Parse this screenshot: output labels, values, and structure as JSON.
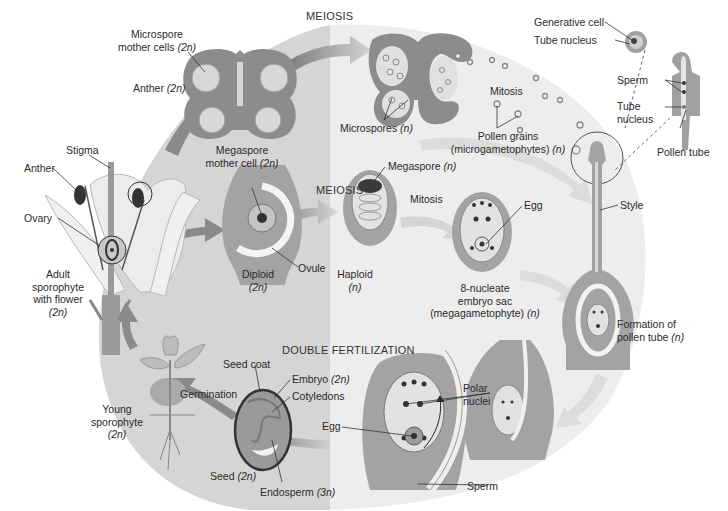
{
  "colors": {
    "diploid_bg": "#d4d4d4",
    "haploid_bg": "#ececec",
    "tissue_dark": "#8c8c8c",
    "tissue_mid": "#a9a9a9",
    "tissue_light": "#c8c8c8",
    "cell_light": "#e2e2e2",
    "arrow": "#8a8a8a",
    "arrow_light": "#cfcfcf"
  },
  "stages": {
    "meiosis_top": "MEIOSIS",
    "meiosis_mid": "MEIOSIS",
    "double_fertilization": "DOUBLE FERTILIZATION",
    "mitosis_top": "Mitosis",
    "mitosis_mid": "Mitosis",
    "germination": "Germination"
  },
  "regions": {
    "diploid": {
      "label": "Diploid",
      "ploidy": "(2n)"
    },
    "haploid": {
      "label": "Haploid",
      "ploidy": "(n)"
    }
  },
  "labels": {
    "microspore_mother_cells": {
      "text": "Microspore",
      "text2": "mother cells",
      "ploidy": "(2n)"
    },
    "anther_top": {
      "text": "Anther",
      "ploidy": "(2n)"
    },
    "microspores": {
      "text": "Microspores",
      "ploidy": "(n)"
    },
    "pollen_grains": {
      "text": "Pollen grains",
      "text2": "(microgametophytes)",
      "ploidy": "(n)"
    },
    "generative_cell": {
      "text": "Generative cell"
    },
    "tube_nucleus_top": {
      "text": "Tube nucleus"
    },
    "sperm_top": {
      "text": "Sperm"
    },
    "tube_nucleus_right": {
      "text": "Tube",
      "text2": "nucleus"
    },
    "pollen_tube": {
      "text": "Pollen tube"
    },
    "stigma": {
      "text": "Stigma"
    },
    "anther_flower": {
      "text": "Anther"
    },
    "ovary": {
      "text": "Ovary"
    },
    "adult_sporophyte": {
      "text": "Adult",
      "text2": "sporophyte",
      "text3": "with flower",
      "ploidy": "(2n)"
    },
    "megaspore_mother_cell": {
      "text": "Megaspore",
      "text2": "mother cell",
      "ploidy": "(2n)"
    },
    "ovule": {
      "text": "Ovule"
    },
    "megaspore": {
      "text": "Megaspore",
      "ploidy": "(n)"
    },
    "egg_top": {
      "text": "Egg"
    },
    "embryo_sac": {
      "text": "8-nucleate",
      "text2": "embryo sac",
      "text3": "(megagametophyte)",
      "ploidy": "(n)"
    },
    "style": {
      "text": "Style"
    },
    "formation_pollen_tube": {
      "text": "Formation of",
      "text2": "pollen tube",
      "ploidy": "(n)"
    },
    "polar_nuclei": {
      "text": "Polar",
      "text2": "nuclei"
    },
    "egg_bottom": {
      "text": "Egg"
    },
    "sperm_bottom": {
      "text": "Sperm"
    },
    "seed_coat": {
      "text": "Seed coat"
    },
    "embryo": {
      "text": "Embryo",
      "ploidy": "(2n)"
    },
    "cotyledons": {
      "text": "Cotyledons"
    },
    "seed": {
      "text": "Seed",
      "ploidy": "(2n)"
    },
    "endosperm": {
      "text": "Endosperm",
      "ploidy": "(3n)"
    },
    "young_sporophyte": {
      "text": "Young",
      "text2": "sporophyte",
      "ploidy": "(2n)"
    }
  }
}
